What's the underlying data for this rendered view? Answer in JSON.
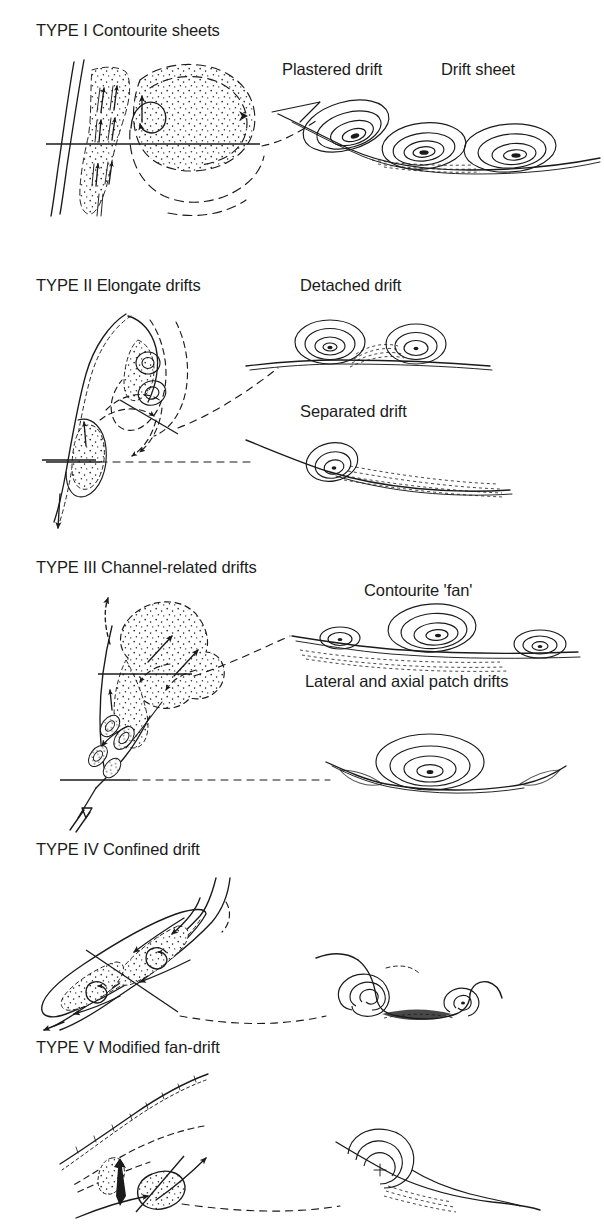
{
  "figure": {
    "kind": "line-diagram",
    "background_color": "#ffffff",
    "ink_color": "#1a1a1a"
  },
  "panels": [
    {
      "id": "type-1",
      "title": "TYPE I Contourite sheets",
      "sublabels": [
        {
          "id": "plastered-drift",
          "text": "Plastered drift"
        },
        {
          "id": "drift-sheet",
          "text": "Drift sheet"
        }
      ],
      "map_view": {
        "description": "Stippled sheet drift hugging a slope with upslope flow arrows and a circulating gyre; a straight section line crosses the body",
        "arrow_count": 8,
        "section_lines": 1
      },
      "cross_section": {
        "description": "Inclined slope profile carrying one plastered drift mound and two sheet-drift mounds, each drawn as nested concentric contours",
        "mounds": 3
      }
    },
    {
      "id": "type-2",
      "title": "TYPE II Elongate drifts",
      "sublabels": [
        {
          "id": "detached-drift",
          "text": "Detached drift"
        },
        {
          "id": "separated-drift",
          "text": "Separated drift"
        }
      ],
      "map_view": {
        "description": "Elongate mounded drifts lying alongside a curving slope with a looping current that detaches from the margin; two section lines",
        "arrow_count": 6,
        "section_lines": 2
      },
      "cross_section": {
        "description": "Upper panel: detached drift with two contoured mounds separated by a moat; lower panel: separated drift, a single mound banked against the slope with a long tapering apron",
        "mounds": 3
      }
    },
    {
      "id": "type-3",
      "title": "TYPE III Channel-related drifts",
      "sublabels": [
        {
          "id": "contourite-fan",
          "text": "Contourite 'fan'"
        },
        {
          "id": "patch-drifts",
          "text": "Lateral and axial patch drifts"
        }
      ],
      "map_view": {
        "description": "Lobate stippled fan spreading downcurrent from a narrow gateway, with patch drifts inside the channel throat and a large open inflow arrow at the base",
        "arrow_count": 7,
        "section_lines": 2
      },
      "cross_section": {
        "description": "Upper panel: broad contourite fan with a large central mound flanked by two smaller mounds; lower panel: axial patch drift filling a channel floor with lateral drifts on each flank",
        "mounds": 4
      }
    },
    {
      "id": "type-4",
      "title": "TYPE IV Confined drift",
      "sublabels": [],
      "map_view": {
        "description": "Lens-shaped drift confined between two converging slopes of a narrow basin, with counter-rotating circulation cells and a section line crossing obliquely",
        "arrow_count": 7,
        "section_lines": 1
      },
      "cross_section": {
        "description": "Two contoured drift mounds confined within a trough, separated by a central moat",
        "mounds": 2
      }
    },
    {
      "id": "type-5",
      "title": "TYPE V Modified fan-drift",
      "sublabels": [],
      "map_view": {
        "description": "Small stippled drift body reworked on the flank of a submarine fan; downslope arrow meets an along-slope arrow, with a section line across the drift",
        "arrow_count": 4,
        "section_lines": 1
      },
      "cross_section": {
        "description": "Single asymmetric mound of nested contours banked on an inclined fan surface",
        "mounds": 1
      }
    }
  ]
}
